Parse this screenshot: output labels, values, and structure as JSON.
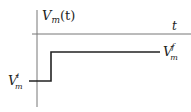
{
  "diagram": {
    "y_label": {
      "main": "V",
      "sub": "m",
      "rest": "(t)"
    },
    "x_label": "t",
    "initial_label": {
      "main": "V",
      "sub": "m",
      "sup": "i"
    },
    "final_label": {
      "main": "V",
      "sub": "m",
      "sup": "f"
    },
    "colors": {
      "axis": "#777777",
      "signal": "#222222"
    }
  }
}
